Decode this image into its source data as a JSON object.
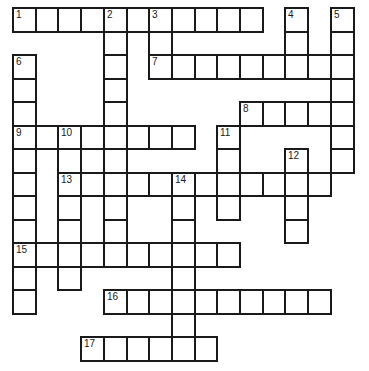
{
  "puzzle": {
    "grid": {
      "origin_x": 12,
      "origin_y": 7,
      "cell_width": 22.7,
      "cell_height": 23.5,
      "columns": 15,
      "rows": 15,
      "line_color": "#1a1a1a",
      "cell_fill": "#ffffff"
    },
    "entries": [
      {
        "number": "1",
        "direction": "across",
        "row": 0,
        "col": 0,
        "length": 11
      },
      {
        "number": "2",
        "direction": "down",
        "row": 0,
        "col": 4,
        "length": 11
      },
      {
        "number": "3",
        "direction": "down",
        "row": 0,
        "col": 6,
        "length": 3
      },
      {
        "number": "4",
        "direction": "down",
        "row": 0,
        "col": 12,
        "length": 3
      },
      {
        "number": "5",
        "direction": "down",
        "row": 0,
        "col": 14,
        "length": 7
      },
      {
        "number": "6",
        "direction": "down",
        "row": 2,
        "col": 0,
        "length": 11
      },
      {
        "number": "7",
        "direction": "across",
        "row": 2,
        "col": 6,
        "length": 9
      },
      {
        "number": "8",
        "direction": "across",
        "row": 4,
        "col": 10,
        "length": 5
      },
      {
        "number": "9",
        "direction": "across",
        "row": 5,
        "col": 0,
        "length": 8
      },
      {
        "number": "10",
        "direction": "down",
        "row": 5,
        "col": 2,
        "length": 7
      },
      {
        "number": "11",
        "direction": "down",
        "row": 5,
        "col": 9,
        "length": 4
      },
      {
        "number": "12",
        "direction": "down",
        "row": 6,
        "col": 12,
        "length": 4
      },
      {
        "number": "13",
        "direction": "across",
        "row": 7,
        "col": 2,
        "length": 12
      },
      {
        "number": "14",
        "direction": "down",
        "row": 7,
        "col": 7,
        "length": 8
      },
      {
        "number": "15",
        "direction": "across",
        "row": 10,
        "col": 0,
        "length": 10
      },
      {
        "number": "16",
        "direction": "across",
        "row": 12,
        "col": 4,
        "length": 10
      },
      {
        "number": "17",
        "direction": "across",
        "row": 14,
        "col": 3,
        "length": 6
      }
    ]
  }
}
